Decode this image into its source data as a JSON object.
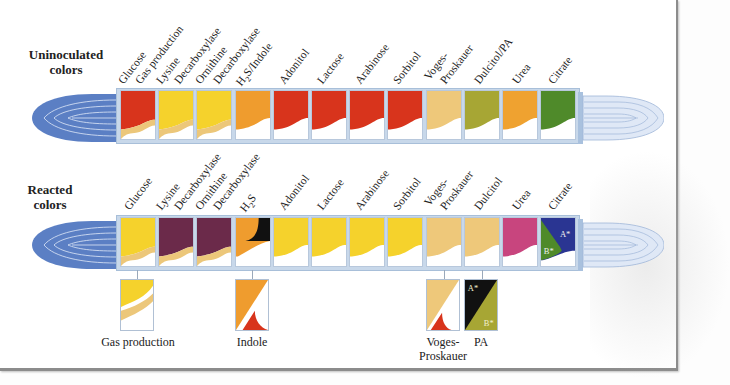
{
  "diagram": {
    "type": "biochemical test strip (Enterotube) color reference",
    "rows": [
      {
        "id": "uninoculated",
        "title_line1": "Uninoculated",
        "title_line2": "colors",
        "labels": [
          "Glucose",
          "Gas production",
          "Lysine",
          "Decarboxylase",
          "Ornithine",
          "Decarboxylase",
          "H₂S/Indole",
          "Adonitol",
          "Lactose",
          "Arabinose",
          "Sorbitol",
          "Voges-",
          "Proskauer",
          "Dulcitol/PA",
          "Urea",
          "Citrate"
        ],
        "compartments": [
          {
            "test": "Glucose / Gas production",
            "top_color": "#d8341c",
            "layer_color": "#ecc77a"
          },
          {
            "test": "Lysine Decarboxylase",
            "top_color": "#f5d22c",
            "layer_color": "#ecc77a"
          },
          {
            "test": "Ornithine Decarboxylase",
            "top_color": "#f5d22c",
            "layer_color": "#ecc77a"
          },
          {
            "test": "H2S/Indole",
            "top_color": "#ef9c2e",
            "layer_color": null
          },
          {
            "test": "Adonitol",
            "top_color": "#d8341c",
            "layer_color": null
          },
          {
            "test": "Lactose",
            "top_color": "#d8341c",
            "layer_color": null
          },
          {
            "test": "Arabinose",
            "top_color": "#d8341c",
            "layer_color": null
          },
          {
            "test": "Sorbitol",
            "top_color": "#d8341c",
            "layer_color": null
          },
          {
            "test": "Voges-Proskauer",
            "top_color": "#eec87a",
            "layer_color": null
          },
          {
            "test": "Dulcitol/PA",
            "top_color": "#a7a634",
            "layer_color": null
          },
          {
            "test": "Urea",
            "top_color": "#efa230",
            "layer_color": null
          },
          {
            "test": "Citrate",
            "top_color": "#4f8a2a",
            "layer_color": null
          }
        ]
      },
      {
        "id": "reacted",
        "title_line1": "Reacted",
        "title_line2": "colors",
        "labels": [
          "Glucose",
          "Lysine",
          "Decarboxylase",
          "Ornithine",
          "Decarboxylase",
          "H₂S",
          "Adonitol",
          "Lactose",
          "Arabinose",
          "Sorbitol",
          "Voges-",
          "Proskauer",
          "Dulcitol",
          "Urea",
          "Citrate"
        ],
        "compartments": [
          {
            "test": "Glucose",
            "top_color": "#f5d22c",
            "layer_color": "#ecc77a"
          },
          {
            "test": "Lysine Decarboxylase",
            "top_color": "#6b2a4a",
            "layer_color": "#ecc77a"
          },
          {
            "test": "Ornithine Decarboxylase",
            "top_color": "#6b2a4a",
            "layer_color": "#ecc77a"
          },
          {
            "test": "H2S",
            "top_color": "#ef9c2e",
            "layer_color": "#111111"
          },
          {
            "test": "Adonitol",
            "top_color": "#f5d22c",
            "layer_color": null
          },
          {
            "test": "Lactose",
            "top_color": "#f5d22c",
            "layer_color": null
          },
          {
            "test": "Arabinose",
            "top_color": "#f5d22c",
            "layer_color": null
          },
          {
            "test": "Sorbitol",
            "top_color": "#f5d22c",
            "layer_color": null
          },
          {
            "test": "Voges-Proskauer",
            "top_color": "#eec87a",
            "layer_color": null
          },
          {
            "test": "Dulcitol",
            "top_color": "#eec87a",
            "layer_color": null
          },
          {
            "test": "Urea",
            "top_color": "#c8457e",
            "layer_color": null
          },
          {
            "test": "Citrate",
            "top_color": "#2a3592",
            "layer_color": "#4f8a2a",
            "marks": [
              "A*",
              "B*"
            ]
          }
        ]
      }
    ],
    "details": [
      {
        "label": "Gas production",
        "under": "Glucose",
        "colors": [
          "#f5d22c",
          "#ecc77a"
        ]
      },
      {
        "label": "Indole",
        "under": "H2S",
        "colors": [
          "#ef9c2e",
          "#d8341c"
        ]
      },
      {
        "label_line1": "Voges-",
        "label_line2": "Proskauer",
        "under": "Voges-Proskauer",
        "colors": [
          "#eec87a",
          "#d8341c"
        ]
      },
      {
        "label": "PA",
        "under": "Dulcitol",
        "colors": [
          "#111111",
          "#a7a634"
        ],
        "marks": [
          "A*",
          "B*"
        ]
      }
    ],
    "tube_color": "#5b7fc4",
    "tube_color_light": "#c9d7ee"
  }
}
